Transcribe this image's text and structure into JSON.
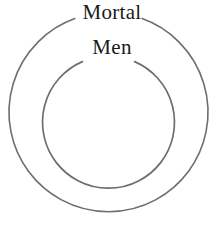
{
  "diagram": {
    "type": "euler-diagram",
    "background_color": "#ffffff",
    "stroke_color": "#6e6e6e",
    "text_color": "#1a1a1a",
    "outer_region": {
      "label": "Mortal",
      "shape": "circle",
      "center_x": 108.5,
      "center_y": 121,
      "radius": 99.5,
      "label_gap_degrees": 44
    },
    "inner_region": {
      "label": "Men",
      "shape": "circle",
      "center_x": 108.5,
      "center_y": 122,
      "radius": 66,
      "label_gap_degrees": 50
    }
  }
}
